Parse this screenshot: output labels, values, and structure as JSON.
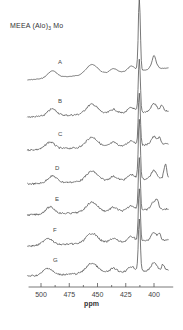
{
  "chart_data": {
    "type": "line",
    "title": "MEEA (Alo)3 Mo",
    "xlabel": "ppm",
    "ylabel": "",
    "xlim": [
      510,
      385
    ],
    "x_reversed": true,
    "x_ticks": [
      500,
      475,
      450,
      425,
      400
    ],
    "stacked": true,
    "grid": false,
    "series": [
      {
        "name": "A",
        "peaks_ppm": [
          490,
          455,
          435,
          415,
          400
        ],
        "major_peak_ppm": 413
      },
      {
        "name": "B",
        "peaks_ppm": [
          490,
          455,
          435,
          413,
          398,
          393
        ],
        "major_peak_ppm": 413
      },
      {
        "name": "C",
        "peaks_ppm": [
          492,
          455,
          413,
          395
        ],
        "major_peak_ppm": 413
      },
      {
        "name": "D",
        "peaks_ppm": [
          490,
          455,
          413,
          398,
          390
        ],
        "major_peak_ppm": 413
      },
      {
        "name": "E",
        "peaks_ppm": [
          492,
          455,
          413,
          397
        ],
        "major_peak_ppm": 413
      },
      {
        "name": "F",
        "peaks_ppm": [
          494,
          455,
          413,
          395
        ],
        "major_peak_ppm": 413
      },
      {
        "name": "G",
        "peaks_ppm": [
          494,
          455,
          413,
          392
        ],
        "major_peak_ppm": 413
      }
    ],
    "legend": "trace labels A-G placed above each trace"
  },
  "labels": {
    "title_main": "MEEA (Alo)",
    "title_sub": "3",
    "title_tail": " Mo",
    "xlabel": "ppm",
    "ticks": [
      "500",
      "475",
      "450",
      "425",
      "400"
    ],
    "traces": [
      "A",
      "B",
      "C",
      "D",
      "E",
      "F",
      "G"
    ]
  }
}
